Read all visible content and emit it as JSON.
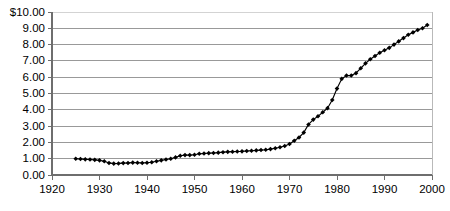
{
  "chart_data": {
    "type": "line",
    "title": "",
    "subtitle": "",
    "xlabel": "",
    "ylabel": "",
    "xlim": [
      1920,
      2000
    ],
    "ylim": [
      0,
      10
    ],
    "grid": true,
    "legend": null,
    "marker": "diamond",
    "series_name": "",
    "ytick_labels": [
      "$10.00",
      "9.00",
      "8.00",
      "7.00",
      "6.00",
      "5.00",
      "4.00",
      "3.00",
      "2.00",
      "1.00",
      "0.00"
    ],
    "ytick_values": [
      10,
      9,
      8,
      7,
      6,
      5,
      4,
      3,
      2,
      1,
      0
    ],
    "xtick_labels": [
      "1920",
      "1930",
      "1940",
      "1950",
      "1960",
      "1970",
      "1980",
      "1990",
      "2000"
    ],
    "xtick_values": [
      1920,
      1930,
      1940,
      1950,
      1960,
      1970,
      1980,
      1990,
      2000
    ],
    "x": [
      1925,
      1926,
      1927,
      1928,
      1929,
      1930,
      1931,
      1932,
      1933,
      1934,
      1935,
      1936,
      1937,
      1938,
      1939,
      1940,
      1941,
      1942,
      1943,
      1944,
      1945,
      1946,
      1947,
      1948,
      1949,
      1950,
      1951,
      1952,
      1953,
      1954,
      1955,
      1956,
      1957,
      1958,
      1959,
      1960,
      1961,
      1962,
      1963,
      1964,
      1965,
      1966,
      1967,
      1968,
      1969,
      1970,
      1971,
      1972,
      1973,
      1974,
      1975,
      1976,
      1977,
      1978,
      1979,
      1980,
      1981,
      1982,
      1983,
      1984,
      1985,
      1986,
      1987,
      1988,
      1989,
      1990,
      1991,
      1992,
      1993,
      1994,
      1995,
      1996,
      1997,
      1998,
      1999
    ],
    "values": [
      1.0,
      0.98,
      0.96,
      0.95,
      0.93,
      0.9,
      0.84,
      0.74,
      0.7,
      0.71,
      0.73,
      0.74,
      0.76,
      0.75,
      0.74,
      0.75,
      0.78,
      0.84,
      0.9,
      0.95,
      1.0,
      1.08,
      1.18,
      1.22,
      1.22,
      1.24,
      1.3,
      1.32,
      1.34,
      1.35,
      1.37,
      1.4,
      1.42,
      1.43,
      1.44,
      1.45,
      1.47,
      1.49,
      1.51,
      1.53,
      1.55,
      1.59,
      1.64,
      1.7,
      1.78,
      1.9,
      2.1,
      2.3,
      2.6,
      3.1,
      3.4,
      3.6,
      3.85,
      4.1,
      4.6,
      5.3,
      5.9,
      6.1,
      6.1,
      6.25,
      6.55,
      6.85,
      7.1,
      7.3,
      7.5,
      7.65,
      7.8,
      8.0,
      8.2,
      8.4,
      8.6,
      8.75,
      8.9,
      9.0,
      9.2
    ]
  }
}
